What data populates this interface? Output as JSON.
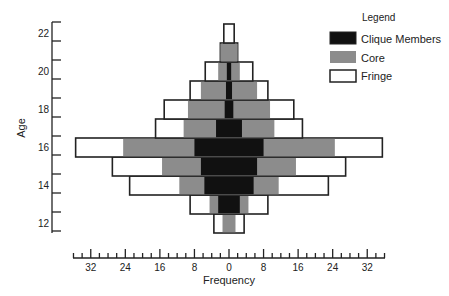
{
  "chart_data": {
    "type": "bar",
    "orientation": "horizontal",
    "subtype": "population-pyramid (symmetric, stacked/nested)",
    "title": "",
    "xlabel": "Frequency",
    "ylabel": "Age",
    "x_ticks": [
      32,
      24,
      16,
      8,
      0,
      8,
      16,
      24,
      32
    ],
    "x_range": [
      -36,
      36
    ],
    "y_ticks": [
      12,
      14,
      16,
      18,
      20,
      22
    ],
    "y_range": [
      11.5,
      22.5
    ],
    "grid": false,
    "legend": {
      "title": "Legend",
      "position": "top-right",
      "entries": [
        {
          "label": "Clique Members",
          "color": "#111111"
        },
        {
          "label": "Core",
          "color": "#8c8c8c"
        },
        {
          "label": "Fringe",
          "color": "#ffffff"
        }
      ]
    },
    "categories": [
      12,
      13,
      14,
      15,
      16,
      17,
      18,
      19,
      20,
      21,
      22
    ],
    "series": [
      {
        "name": "Fringe",
        "note": "half-width per side (outer extent)",
        "values": [
          3.5,
          9,
          23,
          27,
          35.5,
          17,
          15,
          9,
          5.5,
          2,
          1.2
        ]
      },
      {
        "name": "Core",
        "note": "half-width per side (outer extent)",
        "values": [
          1.5,
          4.5,
          11.5,
          15.5,
          24.5,
          10.5,
          9.5,
          6.5,
          2.5,
          2,
          0
        ]
      },
      {
        "name": "Clique Members",
        "note": "half-width per side",
        "values": [
          0,
          2.5,
          5.7,
          6.5,
          8,
          3,
          1,
          0.7,
          0.5,
          0,
          0
        ]
      }
    ]
  },
  "axes": {
    "y_title": "Age",
    "x_title": "Frequency"
  },
  "legend": {
    "title": "Legend",
    "items": [
      {
        "label": "Clique Members",
        "color": "#111111"
      },
      {
        "label": "Core",
        "color": "#8c8c8c"
      },
      {
        "label": "Fringe",
        "color": "#ffffff"
      }
    ]
  },
  "colors": {
    "clique": "#111111",
    "core": "#8c8c8c",
    "fringe": "#ffffff",
    "stroke": "#222222"
  }
}
